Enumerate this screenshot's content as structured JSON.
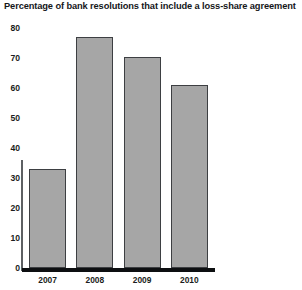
{
  "chart_data": {
    "type": "bar",
    "title": "Percentage of bank resolutions that include a loss-share agreement",
    "xlabel": "",
    "ylabel": "",
    "categories": [
      "2007",
      "2008",
      "2009",
      "2010"
    ],
    "values": [
      33,
      77,
      70.5,
      61
    ],
    "series": [
      {
        "name": "Percentage of bank resolutions that include a loss-share agreement",
        "values": [
          33,
          77,
          70.5,
          61
        ]
      }
    ],
    "ylim": [
      0,
      80
    ],
    "ytick_labels": [
      "0",
      "10",
      "20",
      "30",
      "40",
      "50",
      "60",
      "70",
      "80"
    ],
    "ytick_values": [
      0,
      10,
      20,
      30,
      40,
      50,
      60,
      70,
      80
    ],
    "grid": false,
    "legend": "none",
    "bar_color": "#a6a6a6",
    "bar_border_color": "#3d3f42",
    "axis_color": "#0d0f11",
    "background_color": "#ffffff"
  }
}
